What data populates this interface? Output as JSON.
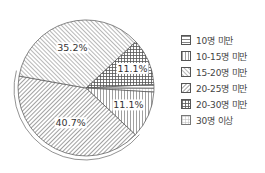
{
  "chart_data": {
    "type": "pie",
    "title": "",
    "legend_position": "right",
    "slices": [
      {
        "label": "10명 미만",
        "value": 0.9,
        "pattern": "horizontal",
        "display_label": ""
      },
      {
        "label": "10-15명 미만",
        "value": 11.1,
        "pattern": "vertical",
        "display_label": "11.1%"
      },
      {
        "label": "15-20명 미만",
        "value": 35.2,
        "pattern": "forward-diagonal",
        "display_label": "35.2%"
      },
      {
        "label": "20-25명 미만",
        "value": 40.7,
        "pattern": "backward-diagonal",
        "display_label": "40.7%"
      },
      {
        "label": "20-30명 미만",
        "value": 11.1,
        "pattern": "crosshatch",
        "display_label": "11.1%"
      },
      {
        "label": "30명 이상",
        "value": 0.9,
        "pattern": "dotted-grid",
        "display_label": ""
      }
    ]
  },
  "legend": {
    "items": [
      {
        "label": "10명 미만",
        "pattern": "horizontal"
      },
      {
        "label": "10-15명 미만",
        "pattern": "vertical"
      },
      {
        "label": "15-20명 미만",
        "pattern": "forward-diagonal"
      },
      {
        "label": "20-25명 미만",
        "pattern": "backward-diagonal"
      },
      {
        "label": "20-30명 미만",
        "pattern": "crosshatch"
      },
      {
        "label": "30명 이상",
        "pattern": "dotted-grid"
      }
    ]
  },
  "colors": {
    "line": "#555555",
    "background": "#ffffff"
  }
}
